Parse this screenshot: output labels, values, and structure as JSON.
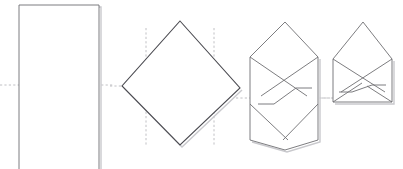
{
  "figure": {
    "background_color": "#ffffff",
    "line_color": "#6e6e72",
    "line_color_dark": "#4a4a50",
    "shadow_color": "#c9c9cd",
    "guide_color": "#b9b9bd",
    "paper_fill": "#ffffff",
    "step_count": 4,
    "canvas": {
      "width": 403,
      "height": 169
    }
  },
  "steps": [
    {
      "index": 1,
      "name": "flat-sheet",
      "label": "Flat rectangular sheet with horizontal centre fold guide",
      "shape": "rectangle",
      "outline": [
        [
          19,
          5
        ],
        [
          99,
          5
        ],
        [
          99,
          169
        ],
        [
          19,
          169
        ]
      ],
      "shadow_offset": [
        2,
        2
      ],
      "guides": [
        {
          "name": "horizontal-centre-fold",
          "orientation": "horizontal",
          "from": [
            0,
            85
          ],
          "to": [
            114,
            85
          ]
        }
      ]
    },
    {
      "index": 2,
      "name": "diamond-orientation",
      "label": "Sheet rotated to diamond with two vertical side fold guides",
      "shape": "diamond",
      "outline": [
        [
          180,
          21
        ],
        [
          240,
          88
        ],
        [
          180,
          145
        ],
        [
          122,
          86
        ]
      ],
      "shadow_offset": [
        2,
        2
      ],
      "guides": [
        {
          "name": "left-vertical-fold",
          "orientation": "vertical",
          "from": [
            146,
            28
          ],
          "to": [
            146,
            146
          ]
        },
        {
          "name": "right-vertical-fold",
          "orientation": "vertical",
          "from": [
            214,
            28
          ],
          "to": [
            214,
            146
          ]
        },
        {
          "name": "horizontal-centre-fold",
          "orientation": "horizontal",
          "from": [
            110,
            86
          ],
          "to": [
            124,
            86
          ]
        }
      ]
    },
    {
      "index": 3,
      "name": "sides-folded-in",
      "label": "Left and right flaps folded inward forming a hexagon with overlapping Z seam",
      "shape": "hexagon-with-z-flaps",
      "outline": [
        [
          285,
          22
        ],
        [
          318,
          57
        ],
        [
          318,
          140
        ],
        [
          285,
          150
        ],
        [
          250,
          140
        ],
        [
          250,
          57
        ]
      ],
      "fold_lines": [
        {
          "name": "left-flap-diagonal",
          "from": [
            250,
            57
          ],
          "to": [
            307,
            96
          ]
        },
        {
          "name": "right-flap-diagonal",
          "from": [
            318,
            57
          ],
          "to": [
            261,
            96
          ]
        },
        {
          "name": "z-seam-upper",
          "from": [
            296,
            88
          ],
          "to": [
            312,
            88
          ]
        },
        {
          "name": "z-seam-lower",
          "from": [
            258,
            104
          ],
          "to": [
            274,
            104
          ]
        },
        {
          "name": "left-lower-diagonal",
          "from": [
            250,
            104
          ],
          "to": [
            290,
            140
          ]
        },
        {
          "name": "right-lower-diagonal",
          "from": [
            318,
            104
          ],
          "to": [
            282,
            140
          ]
        }
      ],
      "shadow_offset": [
        2,
        2
      ],
      "guides": [
        {
          "name": "horizontal-centre-fold",
          "orientation": "horizontal",
          "from": [
            236,
            98
          ],
          "to": [
            330,
            98
          ]
        }
      ]
    },
    {
      "index": 4,
      "name": "finished-envelope",
      "label": "Bottom folded up to complete the envelope with top flap open",
      "shape": "envelope",
      "outline": [
        [
          333,
          59
        ],
        [
          333,
          102
        ],
        [
          392,
          102
        ],
        [
          392,
          59
        ],
        [
          363,
          22
        ]
      ],
      "fold_lines": [
        {
          "name": "left-flap-diagonal",
          "from": [
            333,
            59
          ],
          "to": [
            385,
            92
          ]
        },
        {
          "name": "right-flap-diagonal",
          "from": [
            392,
            59
          ],
          "to": [
            341,
            92
          ]
        },
        {
          "name": "z-seam-upper",
          "from": [
            372,
            85
          ],
          "to": [
            386,
            85
          ]
        },
        {
          "name": "z-seam-lower",
          "from": [
            339,
            92
          ],
          "to": [
            352,
            92
          ]
        },
        {
          "name": "bottom-left-diagonal",
          "from": [
            333,
            102
          ],
          "to": [
            362,
            83
          ]
        },
        {
          "name": "bottom-right-diagonal",
          "from": [
            392,
            102
          ],
          "to": [
            366,
            86
          ]
        }
      ],
      "shadow_offset": [
        2,
        2
      ],
      "guides": [
        {
          "name": "horizontal-centre-fold",
          "orientation": "horizontal",
          "from": [
            322,
            98
          ],
          "to": [
            334,
            98
          ]
        }
      ]
    }
  ]
}
